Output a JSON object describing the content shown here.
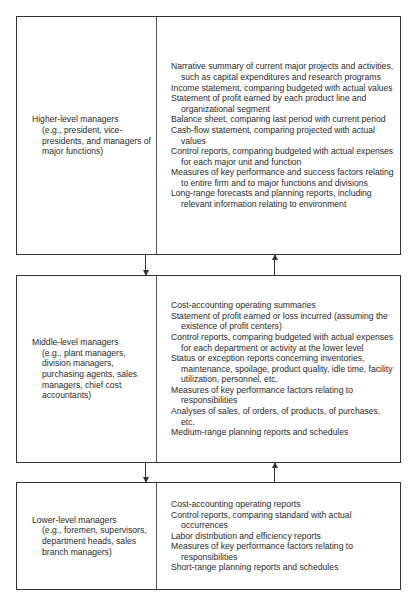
{
  "levels": [
    {
      "title": "Higher-level managers",
      "examples": "(e.g., president, vice-presidents, and managers of major functions)",
      "reports": [
        "Narrative summary of current major projects and activities, such as capital expenditures and research programs",
        "Income statement, comparing budgeted with actual values",
        "Statement of profit earned by each product line and organizational segment",
        "Balance sheet, comparing last period with current period",
        "Cash-flow statement, comparing projected with actual values",
        "Control reports, comparing budgeted with actual expenses for each major unit and function",
        "Measures of key performance and success factors relating to entire firm and to major functions and divisions",
        "Long-range forecasts and planning reports, including relevant information relating to environment"
      ]
    },
    {
      "title": "Middle-level managers",
      "examples": "(e.g., plant managers, division managers, purchasing agents, sales managers, chief cost accountants)",
      "reports": [
        "Cost-accounting operating summaries",
        "Statement of profit earned or loss incurred (assuming the existence of profit centers)",
        "Control reports, comparing budgeted with actual expenses for each department or activity at the lower level",
        "Status or exception reports concerning inventories, maintenance, spoilage, product quality, idle time, facility utilization, personnel, etc.",
        "Measures of key performance factors relating to responsibilities",
        "Analyses of sales, of orders, of products, of purchases, etc.",
        "Medium-range planning reports and schedules"
      ]
    },
    {
      "title": "Lower-level managers",
      "examples": "(e.g., foremen, supervisors, department heads, sales branch managers)",
      "reports": [
        "Cost-accounting operating reports",
        "Control reports, comparing standard with actual occurrences",
        "Labor distribution and efficiency reports",
        "Measures of key performance factors relating to responsibilities",
        "Short-range planning reports and schedules"
      ]
    }
  ],
  "connectors": [
    {
      "between": "higher-middle",
      "down_arrow": true,
      "up_arrow": true
    },
    {
      "between": "middle-lower",
      "down_arrow": true,
      "up_arrow": true
    }
  ]
}
